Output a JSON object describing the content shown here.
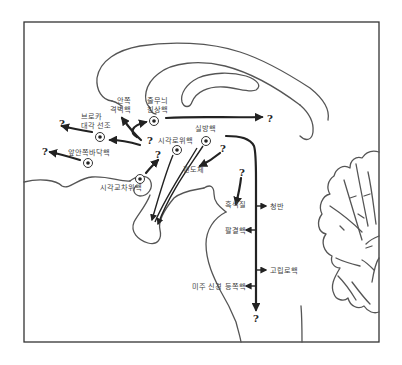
{
  "diagram": {
    "type": "brain-sagittal-pathway-diagram",
    "labels": {
      "medial_septal": "안쪽\n격벽핵",
      "medial_septal_l1": "안쪽",
      "medial_septal_l2": "격벽핵",
      "bed_nucleus": "줄무늬\n침상핵",
      "bed_nucleus_l1": "줄무늬",
      "bed_nucleus_l2": "침상핵",
      "broca_l1": "브로카",
      "broca_l2": "대각 선조",
      "anterior_olfactory": "앞안쪽바닥핵",
      "suprachiasmatic": "시각교차위핵",
      "supraoptic": "시각로위핵",
      "paraventricular": "실방핵",
      "amygdala": "편도체",
      "substantia_nigra": "흑색질",
      "locus_coeruleus": "청반",
      "parabrachial": "팔결핵",
      "raphe": "고립로핵",
      "vagus_dorsal": "미주 신경 등쪽핵"
    },
    "unknown_marker": "?",
    "colors": {
      "line": "#222222",
      "outline": "#555555",
      "text": "#444444",
      "frame": "#333333"
    }
  }
}
